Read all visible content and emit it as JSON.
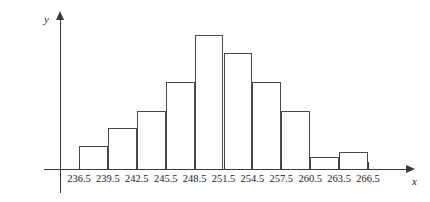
{
  "chart_data": {
    "type": "bar",
    "title": "",
    "subtitle": "",
    "xlabel": "x",
    "ylabel": "y",
    "grid": false,
    "legend": null,
    "bin_width": 3,
    "bin_edges": [
      236.5,
      239.5,
      242.5,
      245.5,
      248.5,
      251.5,
      254.5,
      257.5,
      260.5,
      263.5,
      266.5
    ],
    "tick_labels": [
      "236.5",
      "239.5",
      "242.5",
      "245.5",
      "248.5",
      "251.5",
      "254.5",
      "257.5",
      "260.5",
      "263.5",
      "266.5"
    ],
    "categories": [
      "236.5-239.5",
      "239.5-242.5",
      "242.5-245.5",
      "245.5-248.5",
      "248.5-251.5",
      "251.5-254.5",
      "254.5-257.5",
      "257.5-260.5",
      "260.5-263.5",
      "263.5-266.5"
    ],
    "values": [
      4,
      7,
      10,
      15,
      23,
      20,
      15,
      10,
      2,
      3
    ],
    "xlim": [
      236.5,
      266.5
    ],
    "ylim": [
      0,
      25
    ],
    "axis_arrows": true,
    "y_axis_ticks": false
  },
  "axes": {
    "x_name": "x",
    "y_name": "y"
  },
  "geometry": {
    "baseline_y": 169,
    "left_edge_x": 79,
    "bar_pixel_width": 28.9,
    "pixels_per_unit": 5.82
  }
}
